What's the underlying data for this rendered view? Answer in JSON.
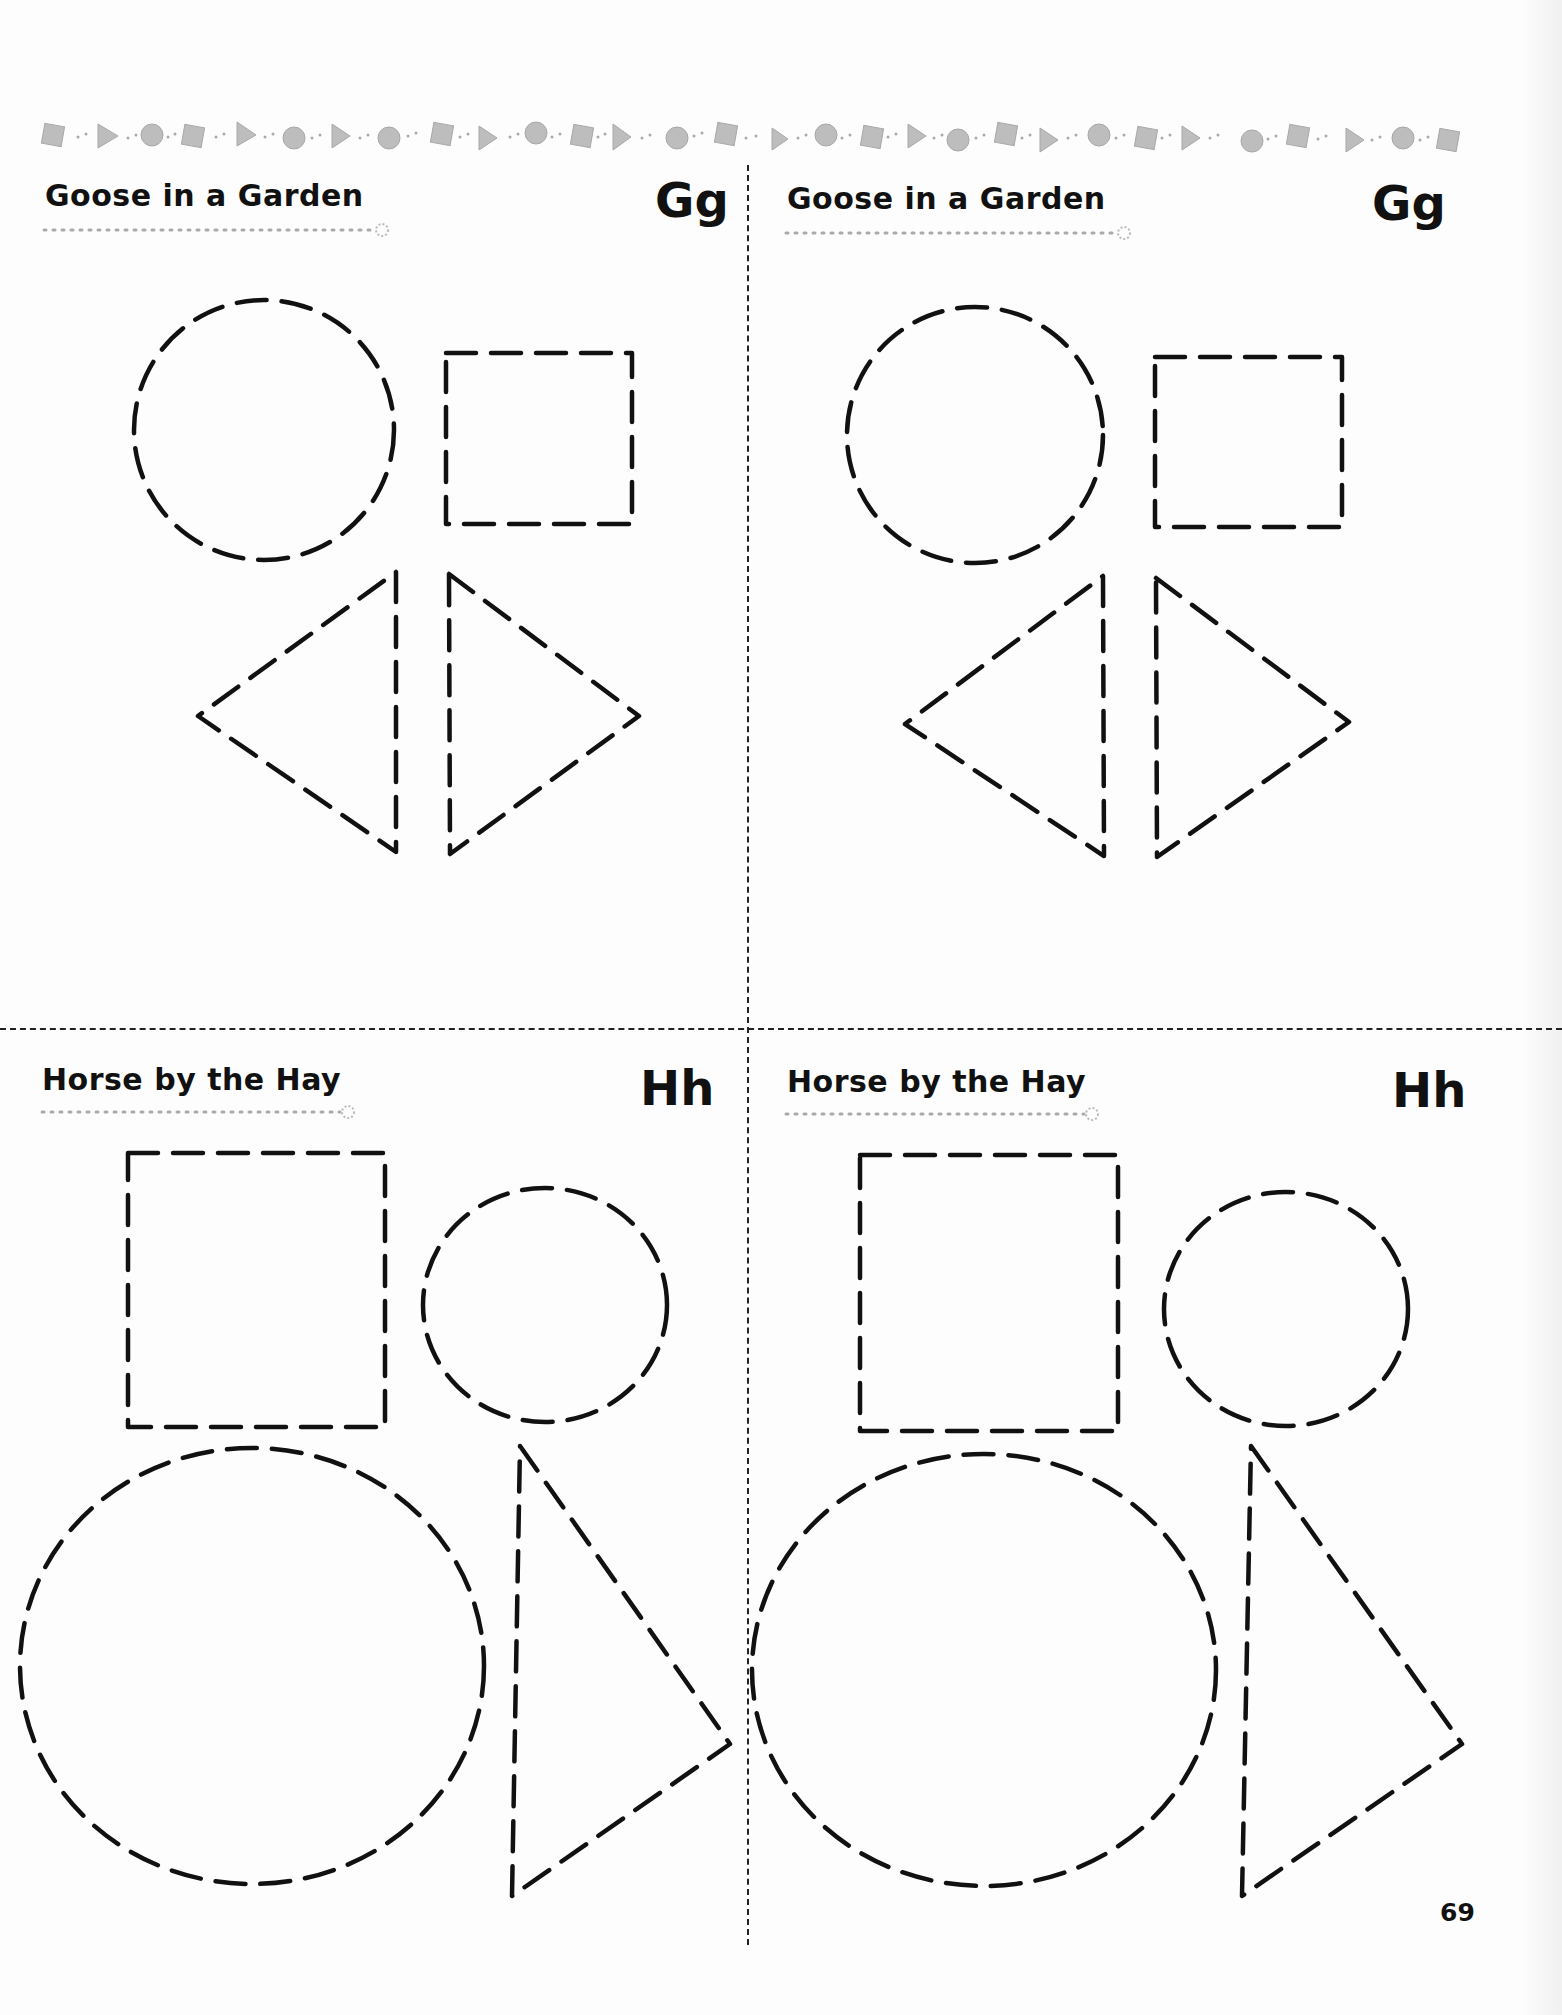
{
  "page": {
    "page_number": "69",
    "ink_color": "#111111",
    "decoration_color": "#b8b8b8"
  },
  "border": {
    "pattern": [
      "square",
      "triangle",
      "circle",
      "square",
      "triangle",
      "circle",
      "triangle",
      "circle",
      "square",
      "triangle",
      "circle",
      "square",
      "triangle",
      "circle",
      "square",
      "triangle",
      "circle",
      "square",
      "triangle",
      "circle",
      "square",
      "triangle",
      "circle",
      "square",
      "triangle",
      "circle",
      "square",
      "triangle",
      "circle",
      "square"
    ]
  },
  "cards": [
    {
      "title": "Goose in a Garden",
      "letter": "Gg",
      "shapes": [
        "circle",
        "square",
        "triangle-left",
        "triangle-right"
      ]
    },
    {
      "title": "Goose in a Garden",
      "letter": "Gg",
      "shapes": [
        "circle",
        "square",
        "triangle-left",
        "triangle-right"
      ]
    },
    {
      "title": "Horse by the Hay",
      "letter": "Hh",
      "shapes": [
        "rectangle",
        "small-circle",
        "large-circle",
        "triangle"
      ]
    },
    {
      "title": "Horse by the Hay",
      "letter": "Hh",
      "shapes": [
        "rectangle",
        "small-circle",
        "large-circle",
        "triangle"
      ]
    }
  ]
}
